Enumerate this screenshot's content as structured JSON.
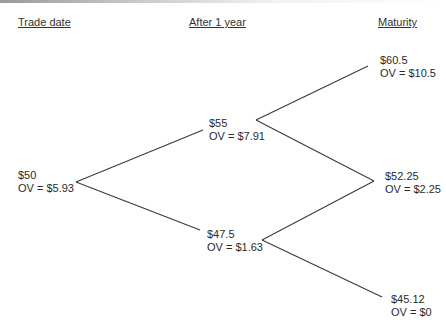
{
  "headers": {
    "trade_date": "Trade date",
    "after_1_year": "After 1 year",
    "maturity": "Maturity"
  },
  "nodes": {
    "root": {
      "price": "$50",
      "ov": "OV = $5.93"
    },
    "up": {
      "price": "$55",
      "ov": "OV = $7.91"
    },
    "down": {
      "price": "$47.5",
      "ov": "OV = $1.63"
    },
    "up_up": {
      "price": "$60.5",
      "ov": "OV = $10.5"
    },
    "up_down": {
      "price": "$52.25",
      "ov": "OV = $2.25"
    },
    "down_down": {
      "price": "$45.12",
      "ov": "OV = $0"
    }
  },
  "colors": {
    "line": "#3a3a3a",
    "text": "#2a2a2a"
  }
}
